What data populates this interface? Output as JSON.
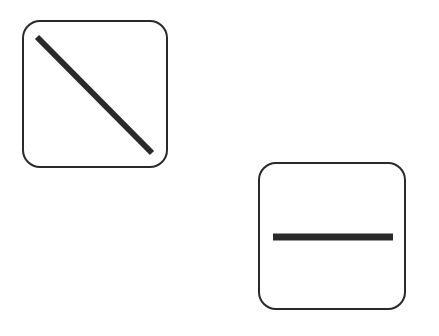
{
  "diagram": {
    "symbols": [
      {
        "name": "diagonal-line-box",
        "box": {
          "x": 22,
          "y": 20,
          "w": 146,
          "h": 148
        },
        "line": {
          "x1": 37,
          "y1": 37,
          "x2": 152,
          "y2": 153
        }
      },
      {
        "name": "horizontal-line-box",
        "box": {
          "x": 258,
          "y": 162,
          "w": 148,
          "h": 148
        },
        "line": {
          "x1": 273,
          "y1": 237,
          "x2": 393,
          "y2": 237
        }
      }
    ],
    "colors": {
      "stroke": "#2a2a2a",
      "background": "#ffffff"
    }
  }
}
